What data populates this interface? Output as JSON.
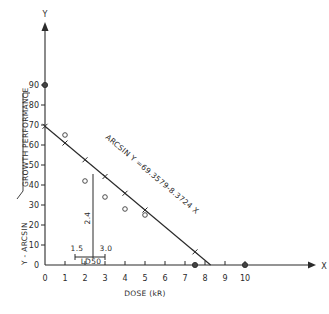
{
  "chart_data": {
    "type": "scatter",
    "title": "",
    "xlabel": "DOSE (kR)",
    "ylabel": "Y - ARCSIN √GROWTH PERFORMANCE",
    "x_axis_name": "X",
    "y_axis_name": "Y",
    "xlim": [
      0,
      10
    ],
    "ylim": [
      0,
      90
    ],
    "x_ticks": [
      0,
      1,
      2,
      3,
      4,
      5,
      6,
      7,
      8,
      9,
      10
    ],
    "y_ticks": [
      0,
      10,
      20,
      30,
      40,
      50,
      60,
      70,
      80,
      90
    ],
    "grid": false,
    "legend": null,
    "series": [
      {
        "name": "observed",
        "marker": "open-circle",
        "points": [
          {
            "x": 0,
            "y": 90
          },
          {
            "x": 1,
            "y": 65
          },
          {
            "x": 2,
            "y": 42
          },
          {
            "x": 3,
            "y": 34
          },
          {
            "x": 4,
            "y": 28
          },
          {
            "x": 5,
            "y": 25
          },
          {
            "x": 7.5,
            "y": 0
          },
          {
            "x": 10,
            "y": 0
          }
        ]
      },
      {
        "name": "regression",
        "type": "line",
        "equation": "ARCSIN Y = 69.3579 - 8.3724 X",
        "intercept": 69.3579,
        "slope": -8.3724,
        "x_range": [
          0,
          8.28
        ],
        "tick_marks_x": [
          0,
          1,
          2,
          3,
          4,
          5,
          7.5
        ]
      }
    ],
    "annotations": [
      {
        "text": "ARCSIN Y = 69.3579-8.3724 X",
        "type": "equation-label"
      },
      {
        "text": "2.4",
        "type": "ld50-value",
        "x": 2.4
      },
      {
        "text": "1.5",
        "type": "ci-lower"
      },
      {
        "text": "3.0",
        "type": "ci-upper"
      },
      {
        "text": "LD50",
        "type": "label"
      }
    ]
  }
}
